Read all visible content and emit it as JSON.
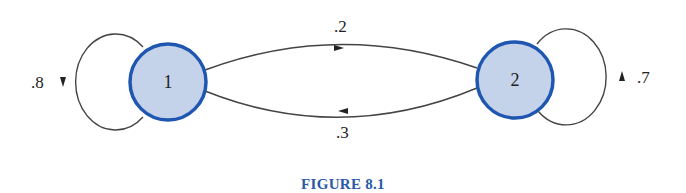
{
  "figure": {
    "caption": "FIGURE 8.1",
    "type": "markov-chain-state-diagram",
    "colors": {
      "node_fill": "#c5d3ea",
      "node_stroke": "#1f56b0",
      "edge": "#444444",
      "caption": "#2a59a8"
    },
    "nodes": [
      {
        "id": "1",
        "label": "1"
      },
      {
        "id": "2",
        "label": "2"
      }
    ],
    "edges": [
      {
        "from": "1",
        "to": "1",
        "label": ".8"
      },
      {
        "from": "1",
        "to": "2",
        "label": ".2"
      },
      {
        "from": "2",
        "to": "1",
        "label": ".3"
      },
      {
        "from": "2",
        "to": "2",
        "label": ".7"
      }
    ]
  }
}
